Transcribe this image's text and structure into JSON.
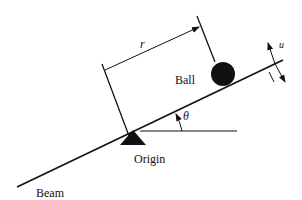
{
  "diagram": {
    "labels": {
      "ball": "Ball",
      "origin": "Origin",
      "beam": "Beam",
      "distance": "r",
      "angle": "θ",
      "input": "u"
    },
    "colors": {
      "stroke": "#111111",
      "fill": "#111111",
      "background": "#ffffff"
    }
  }
}
